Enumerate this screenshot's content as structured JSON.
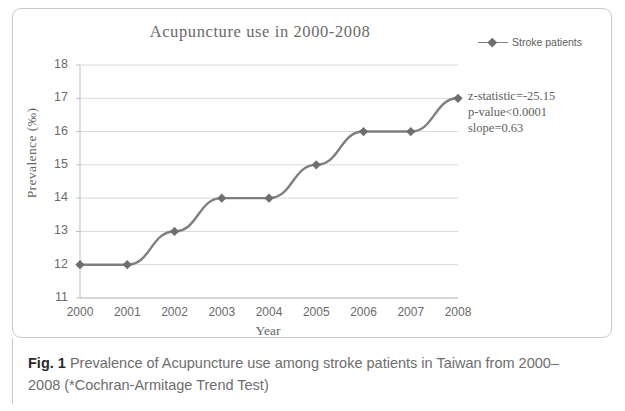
{
  "figure": {
    "caption_label": "Fig. 1",
    "caption_text": " Prevalence of Acupuncture use among stroke patients in Taiwan from 2000–2008 (*Cochran-Armitage Trend Test)"
  },
  "annotation": {
    "z_statistic": "z-statistic=-25.15",
    "p_value": "p-value<0.0001",
    "slope": "slope=0.63"
  },
  "legend": {
    "series_label": "Stroke patients",
    "marker": "diamond-marker",
    "position": "top-right"
  },
  "colors": {
    "line": "#7f7f7f",
    "marker": "#6e6e6e",
    "gridline": "#d9d9d9",
    "axis": "#bfbfbf",
    "text": "#6a6a6a",
    "frame": "#c9c9c9"
  },
  "chart_data": {
    "type": "line",
    "title": "Acupuncture use in  2000-2008",
    "xlabel": "Year",
    "ylabel": "Prevalence (‰)",
    "categories": [
      "2000",
      "2001",
      "2002",
      "2003",
      "2004",
      "2005",
      "2006",
      "2007",
      "2008"
    ],
    "x_tick_labels": [
      "2000",
      "2001",
      "2002",
      "2003",
      "2004",
      "2005",
      "2006",
      "2007",
      "2008"
    ],
    "y_tick_labels": [
      "18",
      "17",
      "16",
      "15",
      "14",
      "13",
      "12",
      "11"
    ],
    "ylim": [
      11,
      18
    ],
    "y_tick_step": 1,
    "grid": "horizontal",
    "legend_position": "top-right",
    "series": [
      {
        "name": "Stroke patients",
        "values": [
          12,
          12,
          13,
          14,
          14,
          15,
          16,
          16,
          17
        ]
      }
    ]
  }
}
